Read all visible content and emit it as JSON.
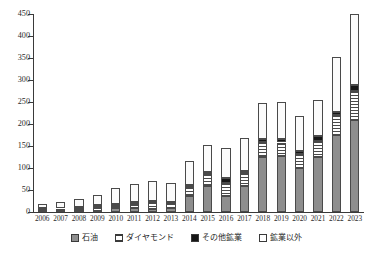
{
  "chart_data": {
    "type": "bar",
    "stacked": true,
    "title": "",
    "xlabel": "",
    "ylabel": "",
    "ylim": [
      0,
      450
    ],
    "ytick_step": 50,
    "yticks": [
      0,
      50,
      100,
      150,
      200,
      250,
      300,
      350,
      400,
      450
    ],
    "grid": false,
    "legend_position": "bottom",
    "categories": [
      "2006",
      "2007",
      "2008",
      "2009",
      "2010",
      "2011",
      "2012",
      "2013",
      "2014",
      "2015",
      "2016",
      "2017",
      "2018",
      "2019",
      "2020",
      "2021",
      "2022",
      "2023"
    ],
    "series": [
      {
        "name": "石油",
        "key": "oil",
        "color": "#8e8e8e",
        "pattern": "solid-gray",
        "values": [
          1,
          2,
          3,
          3,
          9,
          10,
          7,
          8,
          37,
          60,
          37,
          58,
          125,
          128,
          100,
          124,
          175,
          210
        ]
      },
      {
        "name": "ダイヤモンド",
        "key": "diamond",
        "color": "#ffffff",
        "pattern": "horizontal-stripes",
        "values": [
          5,
          6,
          7,
          8,
          7,
          8,
          16,
          12,
          20,
          27,
          30,
          30,
          33,
          30,
          32,
          38,
          45,
          65
        ]
      },
      {
        "name": "その他鉱業",
        "key": "other_mining",
        "color": "#161616",
        "pattern": "solid-black",
        "values": [
          2,
          2,
          2,
          5,
          3,
          4,
          3,
          3,
          4,
          5,
          10,
          5,
          8,
          8,
          6,
          10,
          8,
          14
        ]
      },
      {
        "name": "鉱業以外",
        "key": "non_mining",
        "color": "#fbfbfb",
        "pattern": "solid-white",
        "values": [
          10,
          13,
          17,
          22,
          36,
          42,
          44,
          42,
          54,
          60,
          68,
          75,
          82,
          85,
          80,
          83,
          125,
          161
        ]
      }
    ],
    "totals": [
      18,
      23,
      29,
      38,
      55,
      64,
      70,
      65,
      115,
      152,
      145,
      168,
      248,
      251,
      218,
      255,
      353,
      450
    ]
  },
  "legend": {
    "items": [
      {
        "label": "石油",
        "swatch": "solid-gray"
      },
      {
        "label": "ダイヤモンド",
        "swatch": "horizontal-stripes"
      },
      {
        "label": "その他鉱業",
        "swatch": "solid-black"
      },
      {
        "label": "鉱業以外",
        "swatch": "solid-white"
      }
    ]
  }
}
